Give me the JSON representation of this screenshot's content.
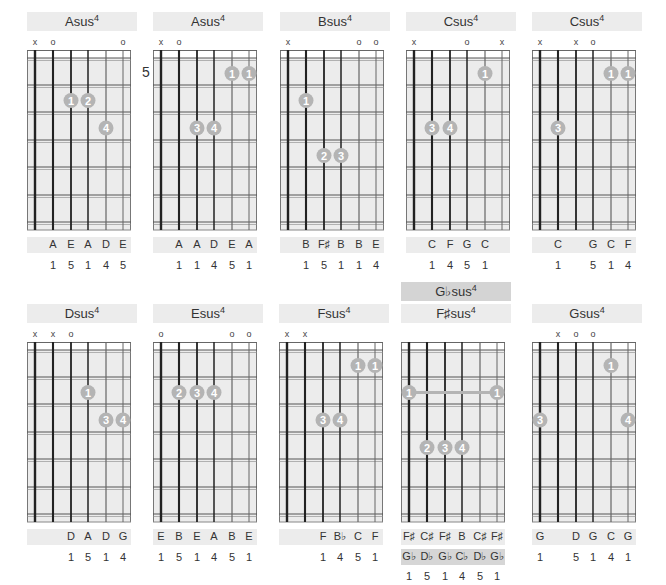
{
  "colors": {
    "grid_bg": "#ececec",
    "title_bg": "#ececec",
    "alt_title_bg": "#d4d4d4",
    "finger_dot": "#b4b4b4",
    "string": "#222222",
    "fret": "#555555"
  },
  "chords": [
    {
      "root": "Asus",
      "sup": "4",
      "x": 27,
      "y": 12,
      "fret_label": "",
      "markers": [
        "x",
        "o",
        "",
        "",
        "",
        "o"
      ],
      "dots": [
        {
          "string": 3,
          "fret": 2,
          "finger": "1"
        },
        {
          "string": 4,
          "fret": 2,
          "finger": "2"
        },
        {
          "string": 5,
          "fret": 3,
          "finger": "4"
        }
      ],
      "barre": null,
      "notes": [
        "",
        "A",
        "E",
        "A",
        "D",
        "E"
      ],
      "degrees": [
        "",
        "1",
        "5",
        "1",
        "4",
        "5"
      ]
    },
    {
      "root": "Asus",
      "sup": "4",
      "x": 153,
      "y": 12,
      "fret_label": "5",
      "markers": [
        "x",
        "o",
        "",
        "",
        "",
        ""
      ],
      "dots": [
        {
          "string": 5,
          "fret": 1,
          "finger": "1"
        },
        {
          "string": 6,
          "fret": 1,
          "finger": "1"
        },
        {
          "string": 3,
          "fret": 3,
          "finger": "3"
        },
        {
          "string": 4,
          "fret": 3,
          "finger": "4"
        }
      ],
      "barre": null,
      "notes": [
        "",
        "A",
        "A",
        "D",
        "E",
        "A"
      ],
      "degrees": [
        "",
        "1",
        "1",
        "4",
        "5",
        "1"
      ]
    },
    {
      "root": "Bsus",
      "sup": "4",
      "x": 280,
      "y": 12,
      "fret_label": "",
      "markers": [
        "x",
        "",
        "",
        "",
        "o",
        "o"
      ],
      "dots": [
        {
          "string": 2,
          "fret": 2,
          "finger": "1"
        },
        {
          "string": 3,
          "fret": 4,
          "finger": "2"
        },
        {
          "string": 4,
          "fret": 4,
          "finger": "3"
        }
      ],
      "barre": null,
      "notes": [
        "",
        "B",
        "F♯",
        "B",
        "B",
        "E"
      ],
      "degrees": [
        "",
        "1",
        "5",
        "1",
        "1",
        "4"
      ]
    },
    {
      "root": "Csus",
      "sup": "4",
      "x": 406,
      "y": 12,
      "fret_label": "",
      "markers": [
        "x",
        "",
        "",
        "o",
        "",
        "x"
      ],
      "dots": [
        {
          "string": 5,
          "fret": 1,
          "finger": "1"
        },
        {
          "string": 2,
          "fret": 3,
          "finger": "3"
        },
        {
          "string": 3,
          "fret": 3,
          "finger": "4"
        }
      ],
      "barre": null,
      "notes": [
        "",
        "C",
        "F",
        "G",
        "C",
        ""
      ],
      "degrees": [
        "",
        "1",
        "4",
        "5",
        "1",
        ""
      ]
    },
    {
      "root": "Csus",
      "sup": "4",
      "x": 532,
      "y": 12,
      "fret_label": "",
      "markers": [
        "x",
        "",
        "x",
        "o",
        "",
        ""
      ],
      "dots": [
        {
          "string": 5,
          "fret": 1,
          "finger": "1"
        },
        {
          "string": 6,
          "fret": 1,
          "finger": "1"
        },
        {
          "string": 2,
          "fret": 3,
          "finger": "3"
        }
      ],
      "barre": null,
      "notes": [
        "",
        "C",
        "",
        "G",
        "C",
        "F"
      ],
      "degrees": [
        "",
        "1",
        "",
        "5",
        "1",
        "4"
      ]
    },
    {
      "root": "Dsus",
      "sup": "4",
      "x": 27,
      "y": 304,
      "fret_label": "",
      "markers": [
        "x",
        "x",
        "o",
        "",
        "",
        ""
      ],
      "dots": [
        {
          "string": 4,
          "fret": 2,
          "finger": "1"
        },
        {
          "string": 5,
          "fret": 3,
          "finger": "3"
        },
        {
          "string": 6,
          "fret": 3,
          "finger": "4"
        }
      ],
      "barre": null,
      "notes": [
        "",
        "",
        "D",
        "A",
        "D",
        "G"
      ],
      "degrees": [
        "",
        "",
        "1",
        "5",
        "1",
        "4"
      ]
    },
    {
      "root": "Esus",
      "sup": "4",
      "x": 153,
      "y": 304,
      "fret_label": "",
      "markers": [
        "o",
        "",
        "",
        "",
        "o",
        "o"
      ],
      "dots": [
        {
          "string": 2,
          "fret": 2,
          "finger": "2"
        },
        {
          "string": 3,
          "fret": 2,
          "finger": "3"
        },
        {
          "string": 4,
          "fret": 2,
          "finger": "4"
        }
      ],
      "barre": null,
      "notes": [
        "E",
        "B",
        "E",
        "A",
        "B",
        "E"
      ],
      "degrees": [
        "1",
        "5",
        "1",
        "4",
        "5",
        "1"
      ]
    },
    {
      "root": "Fsus",
      "sup": "4",
      "x": 279,
      "y": 304,
      "fret_label": "",
      "markers": [
        "x",
        "x",
        "",
        "",
        "",
        ""
      ],
      "dots": [
        {
          "string": 5,
          "fret": 1,
          "finger": "1"
        },
        {
          "string": 6,
          "fret": 1,
          "finger": "1"
        },
        {
          "string": 3,
          "fret": 3,
          "finger": "3"
        },
        {
          "string": 4,
          "fret": 3,
          "finger": "4"
        }
      ],
      "barre": null,
      "notes": [
        "",
        "",
        "F",
        "B♭",
        "C",
        "F"
      ],
      "degrees": [
        "",
        "",
        "1",
        "4",
        "5",
        "1"
      ]
    },
    {
      "root": "F♯sus",
      "sup": "4",
      "alt_root": "G♭sus",
      "alt_sup": "4",
      "x": 401,
      "y": 304,
      "fret_label": "",
      "markers": [
        "",
        "",
        "",
        "",
        "",
        ""
      ],
      "dots": [
        {
          "string": 2,
          "fret": 4,
          "finger": "2"
        },
        {
          "string": 3,
          "fret": 4,
          "finger": "3"
        },
        {
          "string": 4,
          "fret": 4,
          "finger": "4"
        }
      ],
      "barre": {
        "fret": 2,
        "from": 1,
        "to": 6,
        "finger": "1"
      },
      "notes": [
        "F♯",
        "C♯",
        "F♯",
        "B",
        "C♯",
        "F♯"
      ],
      "alt_notes": [
        "G♭",
        "D♭",
        "G♭",
        "C♭",
        "D♭",
        "G♭"
      ],
      "degrees": [
        "1",
        "5",
        "1",
        "4",
        "5",
        "1"
      ]
    },
    {
      "root": "Gsus",
      "sup": "4",
      "x": 532,
      "y": 304,
      "fret_label": "",
      "markers": [
        "",
        "x",
        "o",
        "o",
        "",
        ""
      ],
      "dots": [
        {
          "string": 5,
          "fret": 1,
          "finger": "1"
        },
        {
          "string": 1,
          "fret": 3,
          "finger": "3"
        },
        {
          "string": 6,
          "fret": 3,
          "finger": "4"
        }
      ],
      "barre": null,
      "notes": [
        "G",
        "",
        "D",
        "G",
        "C",
        "G"
      ],
      "degrees": [
        "1",
        "",
        "5",
        "1",
        "4",
        "1"
      ]
    }
  ]
}
